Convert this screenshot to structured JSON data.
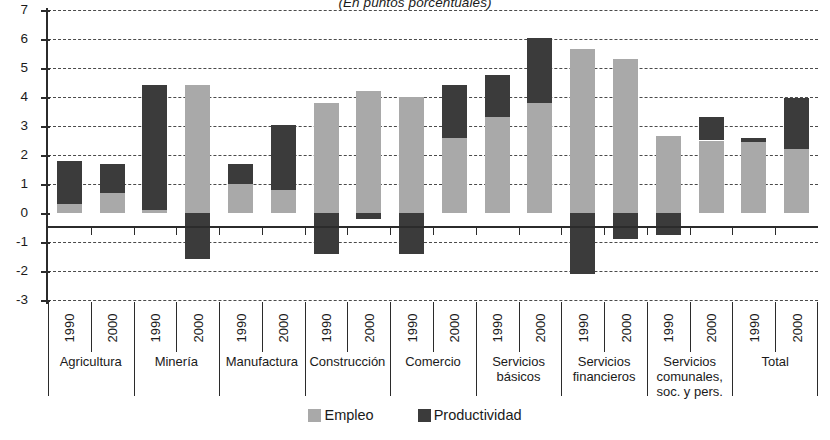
{
  "chart_data": {
    "type": "bar",
    "title": "(En puntos porcentuales)",
    "xlabel": "",
    "ylabel": "",
    "ylim": [
      -3,
      7
    ],
    "yticks": [
      7,
      6,
      5,
      4,
      3,
      2,
      1,
      0,
      -1,
      -2,
      -3
    ],
    "grid": true,
    "stacked": true,
    "legend_position": "bottom",
    "groups": [
      "Agricultura",
      "Minería",
      "Manufactura",
      "Construcción",
      "Comercio",
      "Servicios básicos",
      "Servicios financieros",
      "Servicios comunales, soc. y pers.",
      "Total"
    ],
    "group_labels": [
      [
        "Agricultura"
      ],
      [
        "Minería"
      ],
      [
        "Manufactura"
      ],
      [
        "Construcción"
      ],
      [
        "Comercio"
      ],
      [
        "Servicios",
        "básicos"
      ],
      [
        "Servicios",
        "financieros"
      ],
      [
        "Servicios",
        "comunales,",
        "soc. y pers."
      ],
      [
        "Total"
      ]
    ],
    "subcategories": [
      "1990",
      "2000"
    ],
    "categories": [
      "Agricultura 1990",
      "Agricultura 2000",
      "Minería 1990",
      "Minería 2000",
      "Manufactura 1990",
      "Manufactura 2000",
      "Construcción 1990",
      "Construcción 2000",
      "Comercio 1990",
      "Comercio 2000",
      "Servicios básicos 1990",
      "Servicios básicos 2000",
      "Servicios financieros 1990",
      "Servicios financieros 2000",
      "Servicios comunales 1990",
      "Servicios comunales 2000",
      "Total 1990",
      "Total 2000"
    ],
    "series": [
      {
        "name": "Empleo",
        "color": "#a9a9a9",
        "values": [
          0.3,
          0.7,
          0.1,
          4.4,
          1.0,
          0.8,
          3.8,
          4.2,
          4.0,
          2.6,
          3.3,
          3.8,
          5.65,
          5.3,
          2.65,
          2.5,
          2.45,
          2.2
        ]
      },
      {
        "name": "Productividad",
        "color": "#3b3b3b",
        "values": [
          1.5,
          1.0,
          4.3,
          -1.6,
          0.7,
          2.25,
          -1.4,
          -0.2,
          -1.4,
          1.8,
          1.45,
          2.25,
          -2.1,
          -0.9,
          -0.75,
          0.8,
          0.15,
          1.75
        ]
      }
    ],
    "totals": [
      1.8,
      1.7,
      4.4,
      4.4,
      1.7,
      3.05,
      3.8,
      4.2,
      4.0,
      4.4,
      4.75,
      6.05,
      5.65,
      5.3,
      2.65,
      3.3,
      2.6,
      3.95
    ]
  },
  "legend": [
    {
      "label": "Empleo",
      "swatch": "light-gray-swatch"
    },
    {
      "label": "Productividad",
      "swatch": "dark-gray-swatch"
    }
  ]
}
